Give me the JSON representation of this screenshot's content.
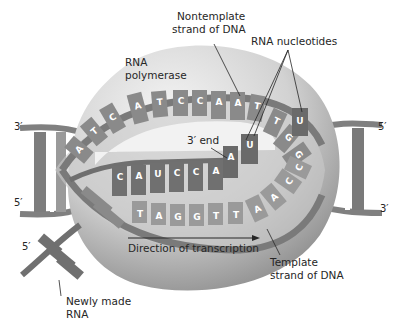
{
  "diagram": {
    "title_cropped": "",
    "labels": {
      "rna_polymerase": [
        "RNA",
        "polymerase"
      ],
      "nontemplate_strand": [
        "Nontemplate",
        "strand of DNA"
      ],
      "rna_nucleotides": "RNA nucleotides",
      "three_prime_end": "3′ end",
      "direction": "Direction of transcription",
      "template_strand": [
        "Template",
        "strand of DNA"
      ],
      "newly_made_rna": [
        "Newly made",
        "RNA"
      ]
    },
    "strand_ends": {
      "left_top": "3′",
      "left_bottom": "5′",
      "right_top": "5′",
      "right_bottom": "3′",
      "rna_5prime": "5′"
    },
    "nontemplate_bases": [
      "A",
      "T",
      "C",
      "A",
      "T",
      "C",
      "C",
      "A",
      "A",
      "T",
      "T",
      "G",
      "G"
    ],
    "rna_bases": [
      "C",
      "A",
      "U",
      "C",
      "C",
      "A"
    ],
    "incoming_nucleotides": [
      "A",
      "U",
      "U"
    ],
    "template_bases": [
      "T",
      "A",
      "G",
      "G",
      "T",
      "T",
      "A",
      "A",
      "C",
      "C"
    ],
    "colors": {
      "polymerase_light": "#e6e6e6",
      "polymerase_dark": "#8c8c8c",
      "dna_strand": "#7a7a7a",
      "base_dark": "#6e6e6e",
      "base_light": "#a8a8a8",
      "label_text": "#262626"
    }
  }
}
